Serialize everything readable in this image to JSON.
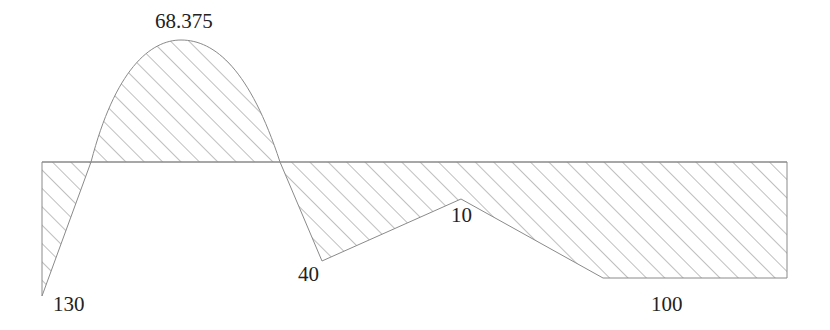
{
  "diagram": {
    "type": "bending-moment-diagram",
    "hatch_color": "#8a8a8a",
    "outline_color": "#8a8a8a",
    "text_color": "#222222",
    "labels": {
      "peak_positive": "68.375",
      "left_end": "130",
      "trough_mid": "40",
      "local_peak": "10",
      "right_end": "100"
    }
  }
}
